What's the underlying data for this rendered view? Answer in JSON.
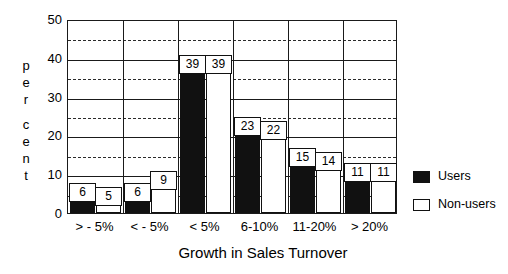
{
  "chart_data": {
    "type": "bar",
    "title": "",
    "xlabel": "Growth in Sales Turnover",
    "ylabel": "per cent",
    "categories": [
      "> - 5%",
      "< - 5%",
      "< 5%",
      "6-10%",
      "11-20%",
      "> 20%"
    ],
    "series": [
      {
        "name": "Users",
        "color": "#111111",
        "values": [
          6,
          6,
          39,
          23,
          15,
          11
        ]
      },
      {
        "name": "Non-users",
        "color": "#ffffff",
        "values": [
          5,
          9,
          39,
          22,
          14,
          11
        ]
      }
    ],
    "ylim": [
      0,
      50
    ],
    "yticks": [
      0,
      10,
      20,
      30,
      40,
      50
    ],
    "yminor": [
      5,
      15,
      25,
      35,
      45
    ],
    "grid": "major-solid-minor-dashed",
    "legend_position": "right",
    "data_labels": true
  },
  "axis": {
    "y_label_letters": [
      "p",
      "e",
      "r",
      "",
      "c",
      "e",
      "n",
      "t"
    ],
    "y_tick_labels": [
      "50",
      "40",
      "30",
      "20",
      "10",
      "0"
    ]
  },
  "legend": {
    "items": [
      {
        "label": "Users",
        "swatch": "users"
      },
      {
        "label": "Non-users",
        "swatch": "nonusers"
      }
    ]
  }
}
